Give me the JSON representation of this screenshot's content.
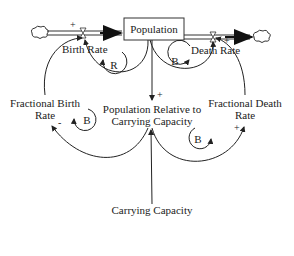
{
  "diagram": {
    "type": "stock-and-flow",
    "stock": {
      "label": "Population"
    },
    "flows": [
      {
        "id": "birth",
        "label": "Birth Rate",
        "direction": "inflow"
      },
      {
        "id": "death",
        "label": "Death Rate",
        "direction": "outflow"
      }
    ],
    "variables": [
      {
        "id": "fbr",
        "line1": "Fractional Birth",
        "line2": "Rate"
      },
      {
        "id": "fdr",
        "line1": "Fractional Death",
        "line2": "Rate"
      },
      {
        "id": "prcc",
        "line1": "Population Relative to",
        "line2": "Carrying Capacity"
      },
      {
        "id": "cc",
        "label": "Carrying Capacity"
      }
    ],
    "loops": [
      {
        "id": "loop-birth",
        "label": "R"
      },
      {
        "id": "loop-death",
        "label": "B"
      },
      {
        "id": "loop-fbr",
        "label": "B"
      },
      {
        "id": "loop-fdr",
        "label": "B"
      }
    ],
    "polarities": {
      "birth_in": "+",
      "death_in": "+",
      "pop_to_prcc": "+",
      "prcc_to_fbr": "-",
      "prcc_to_fdr": "+"
    }
  }
}
